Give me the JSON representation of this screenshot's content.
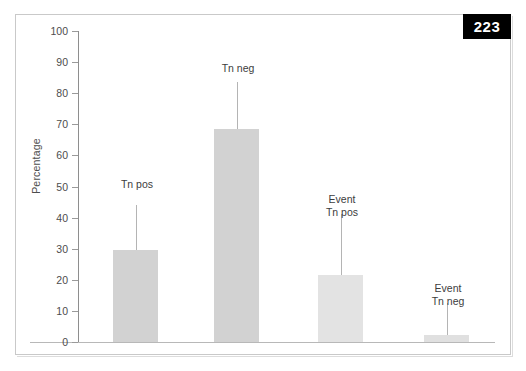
{
  "figure": {
    "page_badge": "223",
    "background_color": "#ffffff",
    "frame_color": "#c9c9c9"
  },
  "chart_data": {
    "type": "bar",
    "title": "",
    "xlabel": "",
    "ylabel": "Percentage",
    "ylim": [
      0,
      100
    ],
    "ytick_labels": [
      "100",
      "90",
      "80",
      "70",
      "60",
      "50",
      "40",
      "30",
      "20",
      "10",
      "0"
    ],
    "ytick_values": [
      100,
      90,
      80,
      70,
      60,
      50,
      40,
      30,
      20,
      10,
      0
    ],
    "grid": false,
    "legend": "none",
    "categories": [
      "Tn pos",
      "Tn neg",
      "Event\nTn pos",
      "Event\nTn neg"
    ],
    "values": [
      29.5,
      68.4,
      21.6,
      2.3
    ],
    "error_upper": [
      44.0,
      83.5,
      41.0,
      12.5
    ],
    "bar_colors": [
      "#d2d2d2",
      "#d2d2d2",
      "#e3e3e3",
      "#e0e0e0"
    ],
    "error_bar_color": "#b4b4b4",
    "bars": [
      {
        "label": "Tn pos",
        "value": 29.5,
        "error_top": 44.0,
        "color": "#d2d2d2",
        "x": 113,
        "width": 45,
        "label_x": 102,
        "label_y": 178,
        "label_width": 70
      },
      {
        "label": "Tn neg",
        "value": 68.4,
        "error_top": 83.5,
        "color": "#d2d2d2",
        "x": 214,
        "width": 45,
        "label_x": 203,
        "label_y": 62,
        "label_width": 70
      },
      {
        "label": "Event\nTn pos",
        "value": 21.6,
        "error_top": 41.0,
        "color": "#e3e3e3",
        "x": 318,
        "width": 45,
        "label_x": 307,
        "label_y": 193,
        "label_width": 70
      },
      {
        "label": "Event\nTn neg",
        "value": 2.3,
        "error_top": 12.5,
        "color": "#e0e0e0",
        "x": 424,
        "width": 45,
        "label_x": 413,
        "label_y": 282,
        "label_width": 70
      }
    ]
  }
}
